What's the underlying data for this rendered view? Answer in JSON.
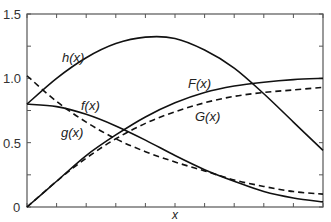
{
  "chart_data": {
    "type": "line",
    "title": "",
    "xlabel": "x",
    "ylabel": "",
    "xlim": [
      0,
      10
    ],
    "ylim": [
      0,
      1.5
    ],
    "yticks": [
      0,
      0.25,
      0.5,
      0.75,
      1.0,
      1.25,
      1.5
    ],
    "ytick_labels": [
      "0",
      "",
      "0.5",
      "",
      "1.0",
      "",
      "1.5"
    ],
    "xticks": [
      0,
      1,
      2,
      3,
      4,
      5,
      6,
      7,
      8,
      9,
      10
    ],
    "xtick_labels": [],
    "grid": false,
    "legend": "inline curve labels",
    "x": [
      0,
      1,
      2,
      3,
      4,
      5,
      6,
      7,
      8,
      9,
      10
    ],
    "series": [
      {
        "name": "h(x)",
        "style": "solid",
        "values": [
          0.8,
          1.0,
          1.16,
          1.27,
          1.32,
          1.31,
          1.22,
          1.08,
          0.88,
          0.66,
          0.44
        ]
      },
      {
        "name": "f(x)",
        "style": "solid",
        "values": [
          0.8,
          0.78,
          0.72,
          0.63,
          0.52,
          0.4,
          0.29,
          0.2,
          0.12,
          0.07,
          0.04
        ]
      },
      {
        "name": "g(x)",
        "style": "dashed",
        "values": [
          1.02,
          0.82,
          0.66,
          0.53,
          0.43,
          0.35,
          0.28,
          0.21,
          0.16,
          0.12,
          0.1
        ]
      },
      {
        "name": "F(x)",
        "style": "solid",
        "values": [
          0.0,
          0.2,
          0.4,
          0.56,
          0.7,
          0.81,
          0.89,
          0.94,
          0.97,
          0.99,
          1.0
        ]
      },
      {
        "name": "G(x)",
        "style": "dashed",
        "values": [
          0.0,
          0.2,
          0.38,
          0.53,
          0.65,
          0.74,
          0.81,
          0.86,
          0.89,
          0.91,
          0.93
        ]
      }
    ],
    "labels": {
      "h": "h(x)",
      "f": "f(x)",
      "g": "g(x)",
      "F": "F(x)",
      "G": "G(x)",
      "x": "x"
    }
  }
}
